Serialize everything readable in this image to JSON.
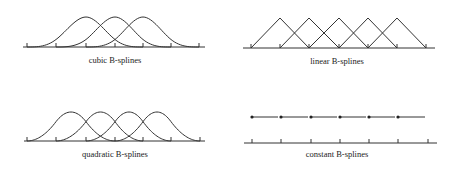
{
  "panels": [
    {
      "id": "cubic",
      "label": "cubic B-splines",
      "degree": 3,
      "axis": {
        "x1": 23,
        "x2": 205,
        "y": 47
      },
      "knots": [
        27,
        56,
        86,
        115,
        143,
        171,
        199
      ],
      "peak_y": 17,
      "curves_start_knot_indices": [
        0,
        1,
        2
      ],
      "label_pos": {
        "x": 115,
        "y": 55
      }
    },
    {
      "id": "linear",
      "label": "linear B-splines",
      "degree": 1,
      "axis": {
        "x1": 243,
        "x2": 435,
        "y": 48
      },
      "knots": [
        251,
        280,
        309,
        339,
        368,
        397,
        426
      ],
      "peak_y": 18,
      "curves_start_knot_indices": [
        0,
        1,
        2,
        3,
        4
      ],
      "label_pos": {
        "x": 337,
        "y": 56
      }
    },
    {
      "id": "quadratic",
      "label": "quadratic B-splines",
      "degree": 2,
      "axis": {
        "x1": 24,
        "x2": 205,
        "y": 141
      },
      "knots": [
        27,
        56,
        86,
        115,
        143,
        171,
        200
      ],
      "peak_y": 112,
      "curves_start_knot_indices": [
        0,
        1,
        2,
        3
      ],
      "label_pos": {
        "x": 115,
        "y": 149
      }
    },
    {
      "id": "constant",
      "label": "constant B-splines",
      "degree": 0,
      "axis": {
        "x1": 244,
        "x2": 437,
        "y": 143
      },
      "knots": [
        252,
        281,
        311,
        340,
        369,
        398,
        428
      ],
      "segment_y": 117,
      "segment_gap": 3,
      "curves_start_knot_indices": [
        0,
        1,
        2,
        3,
        4,
        5
      ],
      "label_pos": {
        "x": 337,
        "y": 149
      }
    }
  ],
  "colors": {
    "line": "#333333",
    "dot": "#222222",
    "background": "#ffffff"
  }
}
